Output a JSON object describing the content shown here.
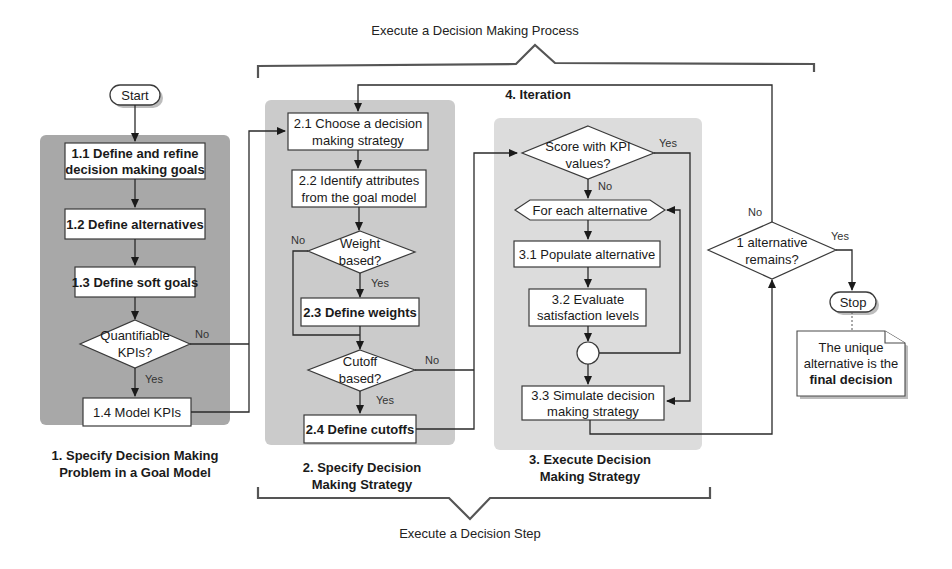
{
  "diagram": {
    "top_brace_label": "Execute a Decision Making Process",
    "bottom_brace_label": "Execute a Decision Step",
    "start_label": "Start",
    "stop_label": "Stop",
    "iteration_label": "4. Iteration",
    "note": {
      "line1": "The unique",
      "line2": "alternative is the",
      "line3": "final decision"
    },
    "phase1": {
      "title_line1": "1. Specify Decision Making",
      "title_line2": "Problem in a Goal Model",
      "step_1_1_line1": "1.1 Define and refine",
      "step_1_1_line2": "decision making goals",
      "step_1_2": "1.2 Define alternatives",
      "step_1_3": "1.3 Define soft goals",
      "decision_kpi_line1": "Quantifiable",
      "decision_kpi_line2": "KPIs?",
      "step_1_4": "1.4 Model KPIs"
    },
    "phase2": {
      "title_line1": "2. Specify Decision",
      "title_line2": "Making Strategy",
      "step_2_1_line1": "2.1 Choose a decision",
      "step_2_1_line2": "making strategy",
      "step_2_2_line1": "2.2 Identify attributes",
      "step_2_2_line2": "from the goal model",
      "decision_weight_line1": "Weight",
      "decision_weight_line2": "based?",
      "step_2_3": "2.3 Define weights",
      "decision_cutoff_line1": "Cutoff",
      "decision_cutoff_line2": "based?",
      "step_2_4": "2.4 Define cutoffs"
    },
    "phase3": {
      "title_line1": "3. Execute Decision",
      "title_line2": "Making Strategy",
      "decision_score_line1": "Score with KPI",
      "decision_score_line2": "values?",
      "loop_label": "For each alternative",
      "step_3_1": "3.1 Populate alternative",
      "step_3_2_line1": "3.2 Evaluate",
      "step_3_2_line2": "satisfaction levels",
      "step_3_3_line1": "3.3 Simulate decision",
      "step_3_3_line2": "making strategy"
    },
    "final_decision_line1": "1 alternative",
    "final_decision_line2": "remains?",
    "labels": {
      "yes": "Yes",
      "no": "No"
    }
  }
}
